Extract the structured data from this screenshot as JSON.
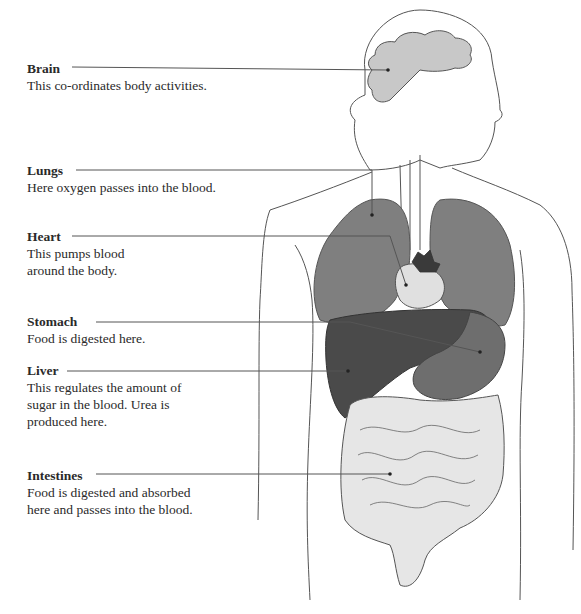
{
  "diagram": {
    "type": "anatomy-labels"
  },
  "labels": [
    {
      "id": "brain",
      "title": "Brain",
      "lines": [
        "This co-ordinates body activities."
      ],
      "top": 60
    },
    {
      "id": "lungs",
      "title": "Lungs",
      "lines": [
        "Here oxygen passes into the blood."
      ],
      "top": 162
    },
    {
      "id": "heart",
      "title": "Heart",
      "lines": [
        "This pumps blood",
        "around the body."
      ],
      "top": 228
    },
    {
      "id": "stomach",
      "title": "Stomach",
      "lines": [
        "Food is digested here."
      ],
      "top": 313
    },
    {
      "id": "liver",
      "title": "Liver",
      "lines": [
        "This regulates the amount of",
        "sugar in the blood. Urea is",
        "produced here."
      ],
      "top": 362
    },
    {
      "id": "intestines",
      "title": "Intestines",
      "lines": [
        "Food is digested and absorbed",
        "here and passes into the blood."
      ],
      "top": 467
    }
  ],
  "colors": {
    "brain": "#c8c8c8",
    "lungs": "#7f7f7f",
    "liver": "#4a4a4a",
    "stomach": "#6e6e6e",
    "intestines": "#e6e6e6",
    "heart": "#d9d9d9",
    "outline": "#555555"
  }
}
